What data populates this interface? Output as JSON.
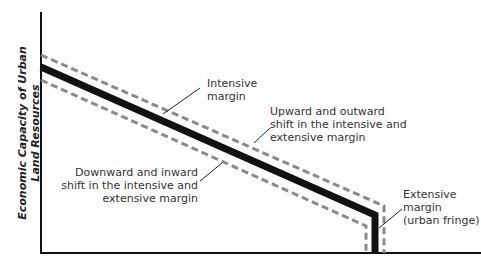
{
  "axes": {
    "y_label_line1": "Economic Capacity of Urban",
    "y_label_line2": "Land Resources"
  },
  "annotations": {
    "intensive_margin": [
      "Intensive",
      "margin"
    ],
    "upward_shift": [
      "Upward and outward",
      "shift in the intensive and",
      "extensive margin"
    ],
    "downward_shift": [
      "Downward and inward",
      "shift in the intensive and",
      "extensive margin"
    ],
    "extensive_margin": [
      "Extensive",
      "margin",
      "(urban fringe)"
    ]
  },
  "colors": {
    "axis": "#111111",
    "solid_line": "#111111",
    "dashed_line": "#8a8a8a",
    "text": "#333333"
  },
  "lines": {
    "solid": {
      "start": [
        41,
        67
      ],
      "corner": [
        375,
        215
      ],
      "end": [
        375,
        253
      ]
    },
    "upper_dashed": {
      "start": [
        41,
        55
      ],
      "corner": [
        384,
        206
      ],
      "end": [
        384,
        253
      ]
    },
    "lower_dashed": {
      "start": [
        41,
        80
      ],
      "corner": [
        366,
        226
      ],
      "end": [
        366,
        253
      ]
    }
  }
}
